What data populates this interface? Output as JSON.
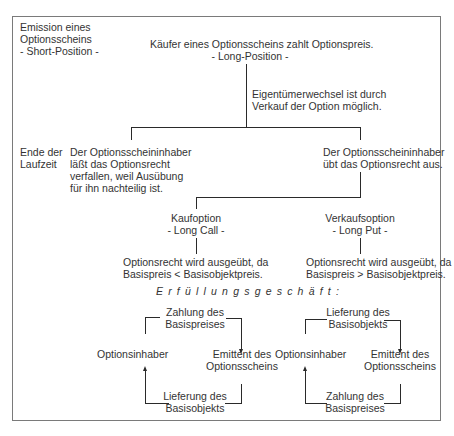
{
  "diagram": {
    "title": "Erfüllungsgeschäft:",
    "left_labels": {
      "emission": [
        "Emission eines",
        "Optionsscheins",
        "- Short-Position -"
      ],
      "end_of_term": [
        "Ende der",
        "Laufzeit"
      ]
    },
    "root": {
      "line1": "Käufer eines Optionsscheins zahlt Optionspreis.",
      "line2": "- Long-Position -"
    },
    "stem_note": [
      "Eigentümerwechsel ist durch",
      "Verkauf der Option möglich."
    ],
    "branch_left": [
      "Der Optionsscheininhaber",
      "läßt das Optionsrecht",
      "verfallen, weil Ausübung",
      "für ihn nachteilig ist."
    ],
    "branch_right": [
      "Der Optionsscheininhaber",
      "übt das Optionsrecht aus."
    ],
    "call": {
      "label": "Kaufoption",
      "sub": "- Long Call -",
      "result": [
        "Optionsrecht wird ausgeübt, da",
        "Basispreis < Basisobjektpreis."
      ]
    },
    "put": {
      "label": "Verkaufsoption",
      "sub": "- Long Put -",
      "result": [
        "Optionsrecht wird ausgeübt, da",
        "Basispreis > Basisobjektpreis."
      ]
    },
    "cycle_call": {
      "top": [
        "Zahlung des",
        "Basispreises"
      ],
      "left": "Optionsinhaber",
      "right": [
        "Emittent des",
        "Optionsscheins"
      ],
      "bottom": [
        "Lieferung des",
        "Basisobjekts"
      ]
    },
    "cycle_put": {
      "top": [
        "Lieferung des",
        "Basisobjekts"
      ],
      "left": "Optionsinhaber",
      "right": [
        "Emittent des",
        "Optionsscheins"
      ],
      "bottom": [
        "Zahlung des",
        "Basispreises"
      ]
    }
  }
}
